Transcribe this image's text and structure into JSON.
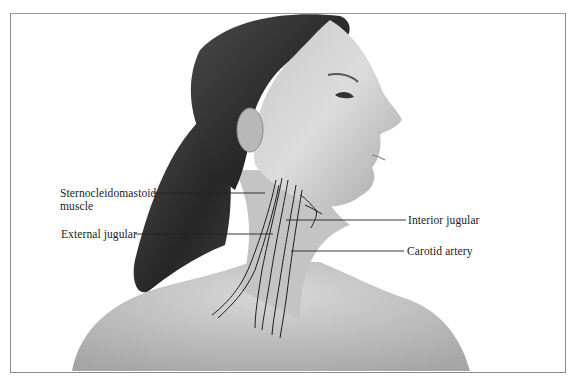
{
  "figure": {
    "labels": {
      "sternocleidomastoid_line1": "Sternocleidomastoid",
      "sternocleidomastoid_line2": "muscle",
      "external_jugular": "External jugular",
      "interior_jugular": "Interior jugular",
      "carotid_artery": "Carotid artery"
    },
    "colors": {
      "background": "#ffffff",
      "frame": "#8a8a8a",
      "label_text": "#1a1a1a",
      "leader_line": "#222222",
      "skin_light": "#d9d9d9",
      "skin_mid": "#b3b3b3",
      "hair_dark": "#2b2b2b"
    }
  }
}
